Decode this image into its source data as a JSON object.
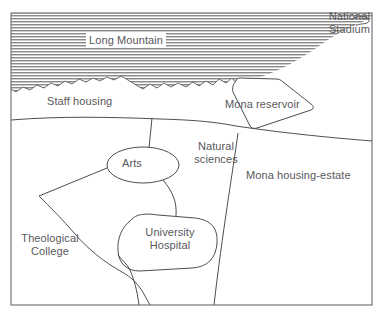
{
  "map": {
    "title": "Mona campus and surroundings map",
    "style": {
      "ink_color": "#3a3a3a",
      "text_color": "#58585a",
      "frame_color": "#6b6b6b",
      "hatch_color": "#8a8a8a",
      "background": "#ffffff"
    },
    "labels": {
      "long_mountain": "Long Mountain",
      "national_stadium_line1": "National",
      "national_stadium_line2": "Stadium",
      "staff_housing": "Staff housing",
      "mona_reservoir": "Mona reservoir",
      "natural_sciences_line1": "Natural",
      "natural_sciences_line2": "sciences",
      "arts": "Arts",
      "mona_housing_estate": "Mona housing-estate",
      "theological_college_line1": "Theological",
      "theological_college_line2": "College",
      "university_hospital_line1": "University",
      "university_hospital_line2": "Hospital"
    },
    "features": [
      {
        "name": "long-mountain",
        "kind": "relief-hatched-area"
      },
      {
        "name": "national-stadium",
        "kind": "point-of-interest"
      },
      {
        "name": "staff-housing",
        "kind": "district"
      },
      {
        "name": "mona-reservoir",
        "kind": "water-body"
      },
      {
        "name": "natural-sciences",
        "kind": "campus-zone"
      },
      {
        "name": "arts",
        "kind": "campus-zone"
      },
      {
        "name": "mona-housing-estate",
        "kind": "district"
      },
      {
        "name": "theological-college",
        "kind": "campus-zone"
      },
      {
        "name": "university-hospital",
        "kind": "campus-zone"
      }
    ]
  }
}
